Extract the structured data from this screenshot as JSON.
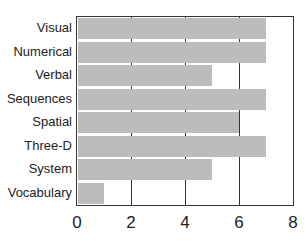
{
  "chart_data": {
    "type": "bar",
    "orientation": "horizontal",
    "title": "",
    "xlabel": "",
    "ylabel": "",
    "categories": [
      "Visual",
      "Numerical",
      "Verbal",
      "Sequences",
      "Spatial",
      "Three-D",
      "System",
      "Vocabulary"
    ],
    "values": [
      7,
      7,
      5,
      7,
      6,
      7,
      5,
      1
    ],
    "xlim": [
      0,
      8
    ],
    "xticks": [
      "0",
      "2",
      "4",
      "6",
      "8"
    ],
    "grid": "vertical at 2, 4, 6",
    "legend": "none",
    "bar_color": "#bcbcbc"
  }
}
